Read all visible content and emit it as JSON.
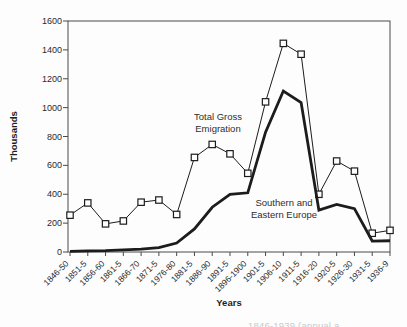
{
  "figure": {
    "y_axis_title": "Thousands",
    "x_axis_title": "Years",
    "caption_fragment": "1846-1939 (annual a",
    "annotations": {
      "total": "Total Gross\nEmigration",
      "southern": "Southern and\nEastern Europe"
    },
    "colors": {
      "line": "#1c1c1c",
      "axis": "#4a4a4a",
      "marker_fill": "#ffffff",
      "text": "#2a2a2a"
    }
  },
  "chart_data": {
    "type": "line",
    "title": "",
    "xlabel": "Years",
    "ylabel": "Thousands",
    "ylim": [
      0,
      1600
    ],
    "ytick_step": 200,
    "grid": false,
    "legend_position": "inline-annotations",
    "categories": [
      "1846-50",
      "1851-5",
      "1856-60",
      "1861-5",
      "1866-70",
      "1871-5",
      "1976-80",
      "1881-5",
      "1886-90",
      "1891-5",
      "1896-1900",
      "1901-5",
      "1906-10",
      "1911-5",
      "1916-20",
      "1920-5",
      "1926-30",
      "1931-5",
      "1936-9"
    ],
    "series": [
      {
        "name": "Total Gross Emigration",
        "marker": "square",
        "line_width": 1,
        "values": [
          255,
          340,
          195,
          215,
          345,
          360,
          260,
          655,
          745,
          680,
          545,
          1040,
          1445,
          1370,
          400,
          630,
          560,
          130,
          150
        ]
      },
      {
        "name": "Southern and Eastern Europe",
        "marker": "none",
        "line_width": 2.8,
        "values": [
          5,
          8,
          10,
          15,
          20,
          30,
          62,
          160,
          310,
          400,
          410,
          830,
          1115,
          1035,
          290,
          330,
          300,
          76,
          78
        ]
      }
    ]
  }
}
